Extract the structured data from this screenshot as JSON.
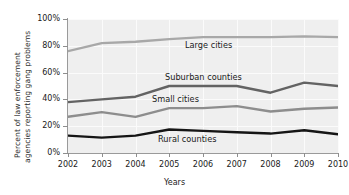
{
  "chart_data": {
    "type": "line",
    "title": "",
    "xlabel": "Years",
    "ylabel": "Percent of law enforcement agencies reporting gang problems",
    "ylabel_line1": "Percent of law enforcement",
    "ylabel_line2": "agencies reporting gang problems",
    "categories": [
      "2002",
      "2003",
      "2004",
      "2005",
      "2006",
      "2007",
      "2008",
      "2009",
      "2010"
    ],
    "x": [
      2002,
      2003,
      2004,
      2005,
      2006,
      2007,
      2008,
      2009,
      2010
    ],
    "ylim": [
      0,
      100
    ],
    "xlim": [
      2002,
      2010
    ],
    "ytick_labels": [
      "0%",
      "20%",
      "40%",
      "60%",
      "80%",
      "100%"
    ],
    "ytick_values": [
      0,
      20,
      40,
      60,
      80,
      100
    ],
    "grid": true,
    "legend_position": "inline-labels",
    "series": [
      {
        "name": "Large cities",
        "color": "#a8a8a8",
        "values": [
          76,
          82,
          83,
          85,
          86.5,
          86.5,
          86.5,
          87,
          86.5
        ]
      },
      {
        "name": "Suburban counties",
        "color": "#636363",
        "values": [
          38,
          40,
          42,
          50,
          50,
          50,
          45,
          52.5,
          50
        ]
      },
      {
        "name": "Small cities",
        "color": "#8d8d8d",
        "values": [
          27,
          30.5,
          27,
          33.5,
          33.5,
          35,
          31,
          33,
          34
        ]
      },
      {
        "name": "Rural counties",
        "color": "#151515",
        "values": [
          13,
          11.5,
          13,
          17.5,
          16.5,
          15.5,
          14.5,
          17,
          14
        ]
      }
    ]
  },
  "labels": {
    "large_cities": "Large cities",
    "suburban_counties": "Suburban counties",
    "small_cities": "Small cities",
    "rural_counties": "Rural counties"
  },
  "axis": {
    "x_title": "Years",
    "y_title_line1": "Percent of law enforcement",
    "y_title_line2": "agencies reporting gang problems"
  },
  "colors": {
    "plot_background": "#efefef",
    "gridline": "#fbfbfb",
    "axis": "#9a9a9a",
    "text": "#1a1a1a"
  }
}
